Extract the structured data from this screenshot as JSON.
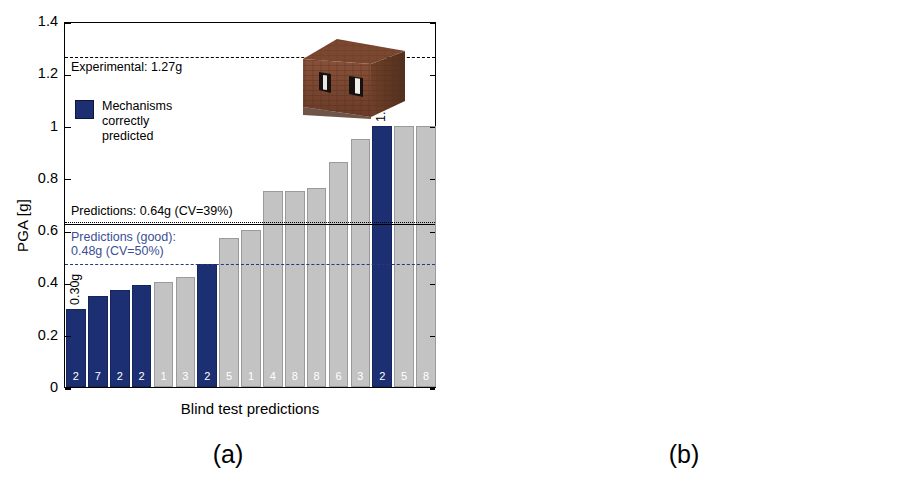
{
  "figure": {
    "panel_a_caption": "(a)",
    "panel_b_caption": "(b)",
    "panel_b_tag": "(c)",
    "ylabel": "PGA [g]",
    "xlabel": "Blind test predictions",
    "legend_label": "Mechanisms\ncorrectly\npredicted",
    "colors": {
      "correct": "#1b2f72",
      "incorrect": "#c3c3c3",
      "good_prediction_line": "#253a7d",
      "experimental_line": "#000000"
    }
  },
  "chart_data": [
    {
      "type": "bar",
      "id": "panel-a",
      "title": "(a)",
      "xlabel": "Blind test predictions",
      "ylabel": "PGA [g]",
      "ylim": [
        0,
        1.4
      ],
      "yticks": [
        "0",
        "0.2",
        "0.4",
        "0.6",
        "0.8",
        "1",
        "1.2",
        "1.4"
      ],
      "ytick_values": [
        0,
        0.2,
        0.4,
        0.6,
        0.8,
        1.0,
        1.2,
        1.4
      ],
      "grid": false,
      "legend_position": "upper-left",
      "bar_labels": [
        "2",
        "7",
        "2",
        "2",
        "1",
        "3",
        "2",
        "5",
        "1",
        "4",
        "8",
        "8",
        "6",
        "3",
        "2",
        "5",
        "8"
      ],
      "values": [
        0.3,
        0.35,
        0.37,
        0.39,
        0.4,
        0.42,
        0.47,
        0.57,
        0.6,
        0.75,
        0.75,
        0.76,
        0.86,
        0.95,
        1.0,
        1.0,
        1.0
      ],
      "correct": [
        true,
        true,
        true,
        true,
        false,
        false,
        true,
        false,
        false,
        false,
        false,
        false,
        false,
        false,
        true,
        false,
        false
      ],
      "value_annotations": [
        {
          "index": 0,
          "text": "0.30g"
        },
        {
          "index": 14,
          "text": "1.00g"
        }
      ],
      "reference_lines": [
        {
          "name": "experimental",
          "value": 1.27,
          "label": "Experimental: 1.27g",
          "style": "dashed",
          "color": "#000000"
        },
        {
          "name": "predictions",
          "value": 0.64,
          "label": "Predictions: 0.64g (CV=39%)",
          "style": "dotted",
          "color": "#000000"
        },
        {
          "name": "predictions-good",
          "value": 0.48,
          "label": "Predictions (good):\n0.48g (CV=50%)",
          "style": "dashed",
          "color": "#253a7d"
        }
      ]
    },
    {
      "type": "bar",
      "id": "panel-b",
      "title": "(b)",
      "tag": "(c)",
      "xlabel": "Blind test predictions",
      "ylabel": "PGA [g]",
      "ylim": [
        0,
        3
      ],
      "yticks": [
        "0",
        "0.5",
        "1",
        "1.5",
        "2",
        "2.5",
        "3"
      ],
      "ytick_values": [
        0,
        0.5,
        1.0,
        1.5,
        2.0,
        2.5,
        3.0
      ],
      "grid": false,
      "legend_position": "upper-left",
      "bar_labels": [
        "7",
        "1",
        "2",
        "5",
        "10",
        "11",
        "4",
        "8",
        "9",
        "1",
        "13",
        "10",
        "11",
        "3",
        "11",
        "12",
        "13",
        "5",
        "6"
      ],
      "values": [
        0.22,
        0.3,
        0.38,
        0.49,
        0.52,
        0.56,
        0.59,
        0.59,
        0.64,
        0.8,
        0.86,
        0.88,
        0.91,
        0.94,
        1.09,
        1.4,
        1.41,
        2.0,
        2.5
      ],
      "correct": [
        false,
        false,
        false,
        false,
        true,
        true,
        false,
        false,
        true,
        false,
        true,
        true,
        true,
        false,
        true,
        true,
        true,
        false,
        false
      ],
      "value_annotations": [
        {
          "index": 0,
          "text": "0.22g"
        },
        {
          "index": 18,
          "text": "2.50g"
        }
      ],
      "reference_lines": [
        {
          "name": "experimental",
          "value": 1.07,
          "label": "Experimental 1.07g",
          "style": "dashed",
          "color": "#000000"
        },
        {
          "name": "predictions-good",
          "value": 0.93,
          "label": "Predictions (good): 0.93g (CV=31%)",
          "style": "dashed",
          "color": "#253a7d"
        },
        {
          "name": "predictions",
          "value": 0.91,
          "label": "Predictions: 0.91g (CV=63%)",
          "style": "dotted",
          "color": "#000000"
        }
      ]
    }
  ]
}
